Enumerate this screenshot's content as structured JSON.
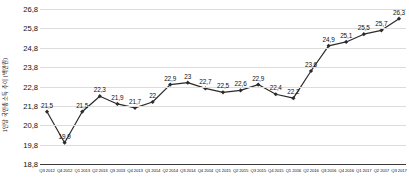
{
  "chart_data": {
    "type": "line",
    "title": "",
    "xlabel": "",
    "ylabel": "1인당 국민총소득 추이 (백만원)",
    "ylim": [
      18.8,
      26.8
    ],
    "yticks": [
      "26,8",
      "25,8",
      "24,8",
      "23,8",
      "22,8",
      "21,8",
      "20,8",
      "19,8",
      "18,8"
    ],
    "ytick_values": [
      26.8,
      25.8,
      24.8,
      23.8,
      22.8,
      21.8,
      20.8,
      19.8,
      18.8
    ],
    "grid": true,
    "legend": "none",
    "marker": "diamond",
    "line_color": "#2b2b2b",
    "grid_color": "#dcdcdc",
    "categories": [
      "Q3 2012",
      "Q4 2012",
      "Q1 2013",
      "Q2 2013",
      "Q3 2013",
      "Q4 2013",
      "Q1 2014",
      "Q2 2014",
      "Q3 2014",
      "Q4 2014",
      "Q1 2015",
      "Q2 2015",
      "Q3 2015",
      "Q4 2015",
      "Q1 2016",
      "Q2 2016",
      "Q3 2016",
      "Q4 2016",
      "Q1 2017",
      "Q2 2017",
      "Q3 2017"
    ],
    "values": [
      21.5,
      19.9,
      21.5,
      22.3,
      21.9,
      21.7,
      22.0,
      22.9,
      23.0,
      22.7,
      22.5,
      22.6,
      22.9,
      22.4,
      22.2,
      23.6,
      24.9,
      25.1,
      25.5,
      25.7,
      26.3
    ],
    "data_labels": [
      "21,5",
      "19,9",
      "21,5",
      "22,3",
      "21,9",
      "21,7",
      "22",
      "22,9",
      "23",
      "22,7",
      "22,5",
      "22,6",
      "22,9",
      "22,4",
      "22,2",
      "23,6",
      "24,9",
      "25,1",
      "25,5",
      "25,7",
      "26,3"
    ]
  }
}
